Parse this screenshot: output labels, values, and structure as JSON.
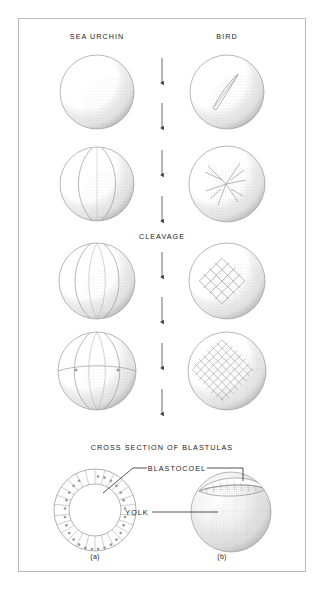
{
  "figure": {
    "column_headers": {
      "left": "SEA URCHIN",
      "right": "BIRD"
    },
    "process_label": "CLEAVAGE",
    "section_title": "CROSS SECTION OF BLASTULAS",
    "annotations": {
      "blastocoel": "BLASTOCOEL",
      "yolk": "YOLK"
    },
    "panel_captions": {
      "a": "(a)",
      "b": "(b)"
    },
    "arrow_count": 8,
    "colors": {
      "ink": "#1b1b1b",
      "outline": "#9a9a9a",
      "stipple": "#8d8d8d",
      "frame": "#b9b9b9",
      "arrow": "#5a5a5a",
      "background": "#ffffff"
    },
    "stages": {
      "sea_urchin": [
        {
          "name": "unfertilized-egg",
          "cells": 1
        },
        {
          "name": "two-cell-stage",
          "cells": 2
        },
        {
          "name": "four-cell-stage",
          "cells": 4
        },
        {
          "name": "eight-cell-stage",
          "cells": 8
        }
      ],
      "bird": [
        {
          "name": "blastodisc-single-furrow",
          "cells": 2
        },
        {
          "name": "blastodisc-radial-furrows",
          "cells": 4
        },
        {
          "name": "blastodisc-grid-early",
          "cells": 16
        },
        {
          "name": "blastodisc-grid-fine",
          "cells": 64
        }
      ]
    },
    "blastulas": {
      "sea_urchin": {
        "name": "hollow-blastula",
        "cell_ring_count": 26
      },
      "bird": {
        "name": "discoidal-blastula"
      }
    }
  }
}
